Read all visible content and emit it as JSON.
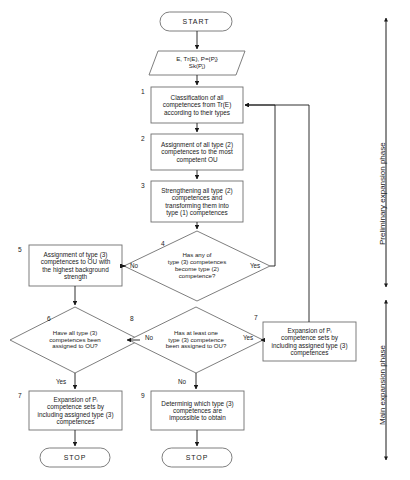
{
  "diagram": {
    "stroke_color": "#6f6f6f",
    "arrow_color": "#1a1a1a",
    "text_color": "#1a1a1a"
  },
  "nodes": {
    "start": {
      "label": "START",
      "shape": "terminal"
    },
    "input": {
      "label": "E, Tr(E), P={Pⱼ}\nSk(Pⱼ)",
      "shape": "parallelogram"
    },
    "step1": {
      "number": "1",
      "label": "Classification of all\ncompetences from Tr(E)\naccording to their types",
      "shape": "process"
    },
    "step2": {
      "number": "2",
      "label": "Assignment of all type (2)\ncompetences  to the most\ncompetent OU",
      "shape": "process"
    },
    "step3": {
      "number": "3",
      "label": "Strengthening  all type (2)\ncompetences  and\ntransforming them into\ntype (1) competences",
      "shape": "process"
    },
    "step4": {
      "number": "4",
      "label": "Has any of\ntype (3) competences\nbecome type (2)\ncompetence?",
      "shape": "decision"
    },
    "step5": {
      "number": "5",
      "label": "Assignment  of type (3)\ncompetences to OU with\nthe highest background\nstrength",
      "shape": "process"
    },
    "step6": {
      "number": "6",
      "label": "Have all type (3)\ncompetences been\nassigned to OU?",
      "shape": "decision"
    },
    "step8": {
      "number": "8",
      "label": "Has at least one\ntype (3) competence\nbeen assigned to OU?",
      "shape": "decision"
    },
    "step7right": {
      "number": "7",
      "label": "Expansion of Pᵢ\ncompetence sets by\nincluding assigned type (3)\ncompetences",
      "shape": "process"
    },
    "step7left": {
      "number": "7",
      "label": "Expansion of Pᵢ\ncompetence sets by\nincluding assigned type (3)\ncompetences",
      "shape": "process"
    },
    "step9": {
      "number": "9",
      "label": "Determinig which type (3)\ncompetences are\nimpossible to obtain",
      "shape": "process"
    },
    "stop_left": {
      "label": "STOP",
      "shape": "terminal"
    },
    "stop_right": {
      "label": "STOP",
      "shape": "terminal"
    }
  },
  "edge_labels": {
    "d4_no": "No",
    "d4_yes": "Yes",
    "d6_no": "No",
    "d6_yes": "Yes",
    "d8_no": "No",
    "d8_yes": "Yes"
  },
  "phases": {
    "preliminary": "Preliminary expansion phase",
    "main": "Main expansion phase"
  },
  "caption": {
    "text": ""
  }
}
